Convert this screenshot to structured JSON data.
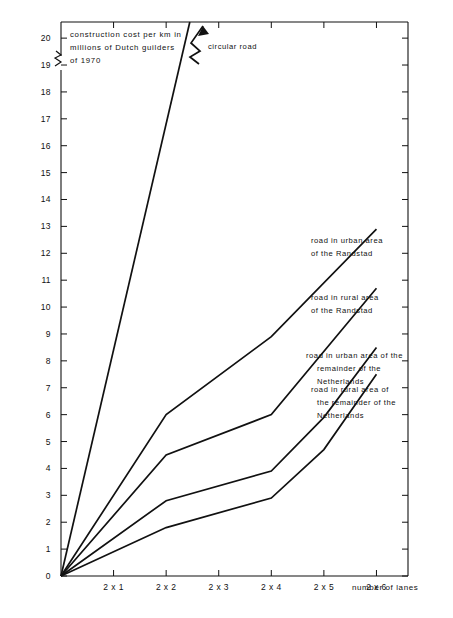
{
  "chart_data": {
    "type": "line",
    "title": "construction cost per km in millions of Dutch guilders of 1970",
    "title_lines": [
      "construction cost per km in",
      "millions of Dutch guilders",
      "of 1970"
    ],
    "xlabel": "number of lanes",
    "ylabel": "construction cost per km in millions of Dutch guilders of 1970",
    "categories": [
      "2 x 1",
      "2 x 2",
      "2 x 3",
      "2 x 4",
      "2 x 5",
      "2 x 6"
    ],
    "x": [
      1,
      2,
      3,
      4,
      5,
      6
    ],
    "xlim": [
      0,
      6.6
    ],
    "ylim": [
      0,
      20.6
    ],
    "y_ticks": [
      0,
      1,
      2,
      3,
      4,
      5,
      6,
      7,
      8,
      9,
      10,
      11,
      12,
      13,
      14,
      15,
      16,
      17,
      18,
      19,
      20
    ],
    "y_axis_break": true,
    "y_axis_break_note": "axis broken above 20",
    "grid": false,
    "legend": "inline annotations at line ends",
    "origin_value": 0,
    "series": [
      {
        "name": "circular road",
        "label_lines": [
          "circular road"
        ],
        "x": [
          0,
          2.45
        ],
        "values": [
          0,
          20.6
        ],
        "truncated": true,
        "note": "line breaks off the top of the chart with a zig-zag break symbol and arrowhead"
      },
      {
        "name": "road in urban area of the Randstad",
        "label_lines": [
          "road in urban area",
          "of the Randstad"
        ],
        "x": [
          0,
          2,
          4,
          6
        ],
        "values": [
          0,
          6.0,
          8.9,
          12.9
        ]
      },
      {
        "name": "road in rural area of the Randstad",
        "label_lines": [
          "road in rural area",
          "of the Randstad"
        ],
        "x": [
          0,
          2,
          4,
          6
        ],
        "values": [
          0,
          4.5,
          6.0,
          10.7
        ]
      },
      {
        "name": "road in urban area of the remainder of the Netherlands",
        "label_lines": [
          "road in urban area of the",
          "remainder of the",
          "Netherlands"
        ],
        "x": [
          0,
          2,
          4,
          5,
          6
        ],
        "values": [
          0,
          2.8,
          3.9,
          5.9,
          8.5
        ]
      },
      {
        "name": "road in rural area of the remainder of the Netherlands",
        "label_lines": [
          "road in rural area of",
          "the remainder of the",
          "Netherlands"
        ],
        "x": [
          0,
          2,
          4,
          5,
          6
        ],
        "values": [
          0,
          1.8,
          2.9,
          4.7,
          7.5
        ]
      }
    ]
  },
  "ticks": {
    "y": [
      "0",
      "1",
      "2",
      "3",
      "4",
      "5",
      "6",
      "7",
      "8",
      "9",
      "10",
      "11",
      "12",
      "13",
      "14",
      "15",
      "16",
      "17",
      "18",
      "19",
      "20"
    ],
    "x": [
      "2 x 1",
      "2 x 2",
      "2 x 3",
      "2 x 4",
      "2 x 5",
      "2 x 6"
    ]
  },
  "annotations": {
    "circular_road": "circular road",
    "urban_randstad_l1": "road in urban area",
    "urban_randstad_l2": "of the Randstad",
    "rural_randstad_l1": "road in rural area",
    "rural_randstad_l2": "of the Randstad",
    "urban_remainder_l1": "road in urban area of the",
    "urban_remainder_l2": "remainder of the",
    "urban_remainder_l3": "Netherlands",
    "rural_remainder_l1": "road in rural area of",
    "rural_remainder_l2": "the remainder of the",
    "rural_remainder_l3": "Netherlands",
    "title_l1": "construction cost per km in",
    "title_l2": "millions of Dutch guilders",
    "title_l3": "of 1970",
    "xaxis_caption": "number of lanes"
  },
  "colors": {
    "ink": "#111111",
    "background": "#ffffff"
  }
}
